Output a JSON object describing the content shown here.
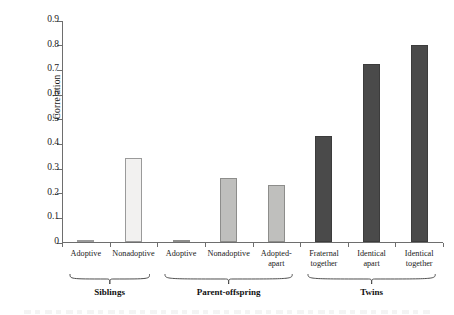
{
  "chart_data": {
    "type": "bar",
    "title": "",
    "xlabel": "",
    "ylabel": "Correlation",
    "ylim": [
      0,
      0.9
    ],
    "ytick_values": [
      0,
      0.1,
      0.2,
      0.3,
      0.4,
      0.5,
      0.6,
      0.7,
      0.8,
      0.9
    ],
    "ytick_labels": [
      "0",
      "0.1",
      "0.2",
      "0.3",
      "0.4",
      "0.5",
      "0.6",
      "0.7",
      "0.8",
      "0.9"
    ],
    "grid": false,
    "legend": "none",
    "categories": [
      "Adoptive",
      "Nonadoptive",
      "Adoptive",
      "Nonadoptive",
      "Adopted-apart",
      "Fraternal together",
      "Identical apart",
      "Identical together"
    ],
    "values": [
      0.01,
      0.34,
      0.01,
      0.26,
      0.23,
      0.43,
      0.72,
      0.8
    ],
    "bars": [
      {
        "label_line1": "Adoptive",
        "label_line2": "",
        "value": 0.01,
        "group": "Siblings",
        "shade": "light"
      },
      {
        "label_line1": "Nonadoptive",
        "label_line2": "",
        "value": 0.34,
        "group": "Siblings",
        "shade": "light"
      },
      {
        "label_line1": "Adoptive",
        "label_line2": "",
        "value": 0.01,
        "group": "Parent-offspring",
        "shade": "medium"
      },
      {
        "label_line1": "Nonadoptive",
        "label_line2": "",
        "value": 0.26,
        "group": "Parent-offspring",
        "shade": "medium"
      },
      {
        "label_line1": "Adopted-",
        "label_line2": "apart",
        "value": 0.23,
        "group": "Parent-offspring",
        "shade": "medium"
      },
      {
        "label_line1": "Fraternal",
        "label_line2": "together",
        "value": 0.43,
        "group": "Twins",
        "shade": "dark"
      },
      {
        "label_line1": "Identical",
        "label_line2": "apart",
        "value": 0.72,
        "group": "Twins",
        "shade": "dark"
      },
      {
        "label_line1": "Identical",
        "label_line2": "together",
        "value": 0.8,
        "group": "Twins",
        "shade": "dark"
      }
    ],
    "groups": [
      {
        "name": "Siblings",
        "bar_start": 0,
        "bar_end": 1
      },
      {
        "name": "Parent-offspring",
        "bar_start": 2,
        "bar_end": 4
      },
      {
        "name": "Twins",
        "bar_start": 5,
        "bar_end": 7
      }
    ],
    "colors": {
      "light": "#f2f1f0",
      "medium": "#bfbfbd",
      "dark": "#4a4a4a",
      "axis": "#6e6e6e",
      "text": "#1a1a1a",
      "background": "#ffffff"
    }
  }
}
